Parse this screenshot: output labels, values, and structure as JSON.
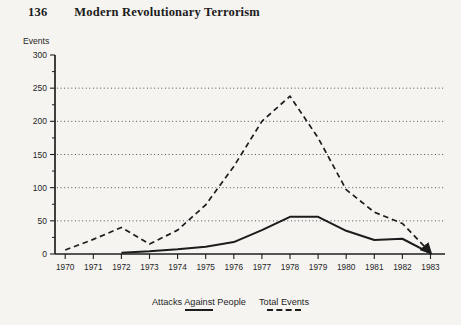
{
  "page": {
    "number": "136",
    "header_title": "Modern Revolutionary Terrorism"
  },
  "chart_data": {
    "type": "line",
    "title": "",
    "xlabel": "",
    "ylabel": "Events",
    "x": [
      "1970",
      "1971",
      "1972",
      "1973",
      "1974",
      "1975",
      "1976",
      "1977",
      "1978",
      "1979",
      "1980",
      "1981",
      "1982",
      "1983"
    ],
    "series": [
      {
        "name": "Attacks Against People",
        "style": "solid",
        "values": [
          null,
          null,
          2,
          4,
          7,
          11,
          18,
          36,
          56,
          56,
          35,
          21,
          23,
          1
        ]
      },
      {
        "name": "Total Events",
        "style": "dashed",
        "arrow_end": true,
        "values": [
          6,
          22,
          40,
          15,
          36,
          74,
          132,
          200,
          238,
          175,
          97,
          63,
          46,
          2
        ]
      }
    ],
    "ylim": [
      0,
      300
    ],
    "y_ticks": [
      0,
      50,
      100,
      150,
      200,
      250,
      300
    ],
    "y_minor_tick_step": 25,
    "gridlines": [
      50,
      100,
      150,
      200,
      250
    ],
    "grid_style": "dotted-horizontal",
    "legend_position": "bottom-center",
    "colors": {
      "ink": "#1c1c1c",
      "page_bg": "#f5f4f1"
    }
  }
}
